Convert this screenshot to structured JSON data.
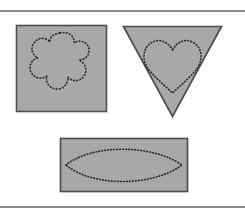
{
  "figure": {
    "background_color": "#ffffff",
    "rules": {
      "stroke_color": "#8a8a8a",
      "top_y": 10,
      "bottom_y": 206,
      "thickness": 2
    },
    "shape_fill_color": "#a8a8a8",
    "shape_outline_color": "#4d4d4d",
    "dotted_curve_color": "#2b2b2b",
    "panels": [
      {
        "id": "panel-square-flower",
        "container_shape": "square",
        "container_label": "square",
        "inner_curve": "flower",
        "inner_curve_label": "six-lobed flower outline",
        "inner_curve_style": "dotted",
        "x": 16,
        "y": 25,
        "width": 91,
        "height": 87
      },
      {
        "id": "panel-triangle-heart",
        "container_shape": "inverted-triangle",
        "container_label": "downward-pointing triangle",
        "inner_curve": "heart",
        "inner_curve_label": "heart outline",
        "inner_curve_style": "dotted",
        "x": 123,
        "y": 26,
        "width": 99,
        "height": 91
      },
      {
        "id": "panel-rectangle-lens",
        "container_shape": "rectangle",
        "container_label": "rectangle",
        "inner_curve": "lens",
        "inner_curve_label": "lens (vesica) outline",
        "inner_curve_style": "dotted",
        "x": 60,
        "y": 138,
        "width": 128,
        "height": 54
      }
    ]
  }
}
